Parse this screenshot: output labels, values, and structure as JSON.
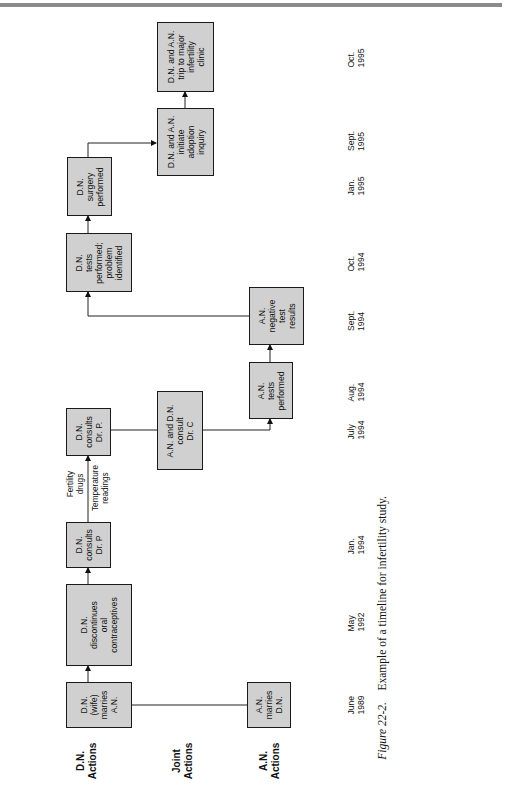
{
  "figure": {
    "caption_label": "Figure 22-2.",
    "caption_text": "Example of a timeline for infertility study."
  },
  "rows": {
    "dn": "D.N.\nActions",
    "joint": "Joint\nActions",
    "an": "A.N.\nActions"
  },
  "boxes": {
    "dn_marries": "D.N.\n(wife)\nmarries\nA.N.",
    "an_marries": "A.N.\nmarries\nD.N.",
    "dn_discontinues": "D.N.\ndiscontinues\noral\ncontraceptives",
    "dn_consults_p1": "D.N.\nconsults\nDr. P",
    "dn_consults_p2": "D.N.\nconsults\nDr. P.",
    "joint_consult_c": "A.N. and D.N.\nconsult\nDr. C",
    "an_tests": "A.N.\ntests\nperformed",
    "an_negative": "A.N.\nnegative\ntest\nresults",
    "dn_tests_problem": "D.N.\ntests\nperformed;\nproblem\nidentified",
    "dn_surgery": "D.N.\nsurgery\nperformed",
    "joint_adoption": "D.N. and A.N.\ninitiate\nadoption\ninquiry",
    "joint_trip": "D.N. and A.N.\ntrip to major\ninfertility\nclinic"
  },
  "notes": {
    "fertility_drugs": "Fertility\ndrugs",
    "temperature": "Temperature\nreadings"
  },
  "dates": [
    {
      "label": "June\n1989"
    },
    {
      "label": "May\n1992"
    },
    {
      "label": "Jan.\n1994"
    },
    {
      "label": "July\n1994"
    },
    {
      "label": "Aug.\n1994"
    },
    {
      "label": "Sept.\n1994"
    },
    {
      "label": "Oct.\n1994"
    },
    {
      "label": "Jan.\n1995"
    },
    {
      "label": "Sept.\n1995"
    },
    {
      "label": "Oct.\n1995"
    }
  ]
}
